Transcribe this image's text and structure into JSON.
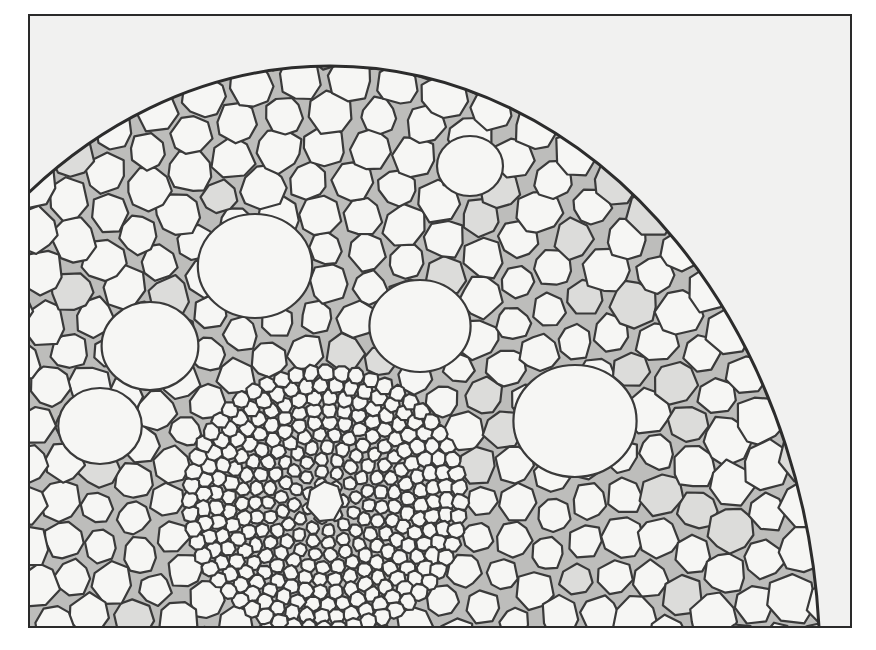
{
  "image": {
    "subject": "micrograph-plant-stem-cross-section",
    "background_color": "#ffffff",
    "frame": {
      "x": 28,
      "y": 14,
      "width": 824,
      "height": 614,
      "border_color": "#2a2a2a"
    },
    "colors": {
      "outside_tissue": "#f1f1f0",
      "cell_fill": "#f6f6f4",
      "cell_fill_shaded": "#dcdcda",
      "cell_wall": "#3a3a3a",
      "epidermis": "#2c2c2c"
    },
    "regions": [
      {
        "name": "epidermis",
        "description": "curved outer boundary arcing from left edge to lower right"
      },
      {
        "name": "cortex",
        "description": "large rounded parenchyma cells with some shaded cells"
      },
      {
        "name": "air-spaces",
        "description": "several large empty lacunae in cortex"
      },
      {
        "name": "vascular-center",
        "description": "cluster of small cells around a central larger cell near bottom center"
      }
    ]
  }
}
